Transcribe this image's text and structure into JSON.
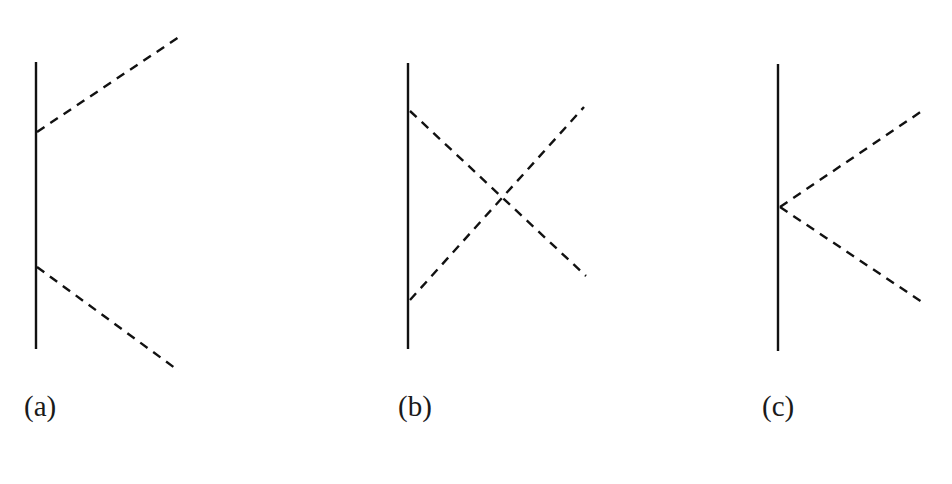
{
  "diagrams": [
    {
      "id": "a",
      "label": "(a)",
      "label_pos": [
        24,
        390
      ],
      "solid": {
        "x1": 36,
        "y1": 62,
        "x2": 36,
        "y2": 349
      },
      "dashed": [
        {
          "x1": 37,
          "y1": 132,
          "x2": 179,
          "y2": 37
        },
        {
          "x1": 37,
          "y1": 267,
          "x2": 179,
          "y2": 371
        }
      ]
    },
    {
      "id": "b",
      "label": "(b)",
      "label_pos": [
        398,
        390
      ],
      "solid": {
        "x1": 408,
        "y1": 63,
        "x2": 408,
        "y2": 349
      },
      "dashed": [
        {
          "x1": 410,
          "y1": 111,
          "x2": 586,
          "y2": 276
        },
        {
          "x1": 410,
          "y1": 300,
          "x2": 584,
          "y2": 107
        }
      ]
    },
    {
      "id": "c",
      "label": "(c)",
      "label_pos": [
        762,
        390
      ],
      "solid": {
        "x1": 778,
        "y1": 64,
        "x2": 778,
        "y2": 351
      },
      "dashed": [
        {
          "x1": 780,
          "y1": 207,
          "x2": 922,
          "y2": 111
        },
        {
          "x1": 780,
          "y1": 207,
          "x2": 925,
          "y2": 304
        }
      ]
    }
  ],
  "style": {
    "stroke": "#111111",
    "solid_width": 2.4,
    "dashed_width": 2.4,
    "dash": "9 7"
  }
}
